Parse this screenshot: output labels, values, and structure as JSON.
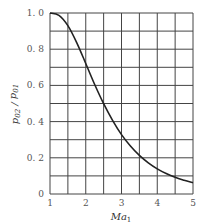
{
  "chart_data": {
    "type": "line",
    "title": "",
    "xlabel": "Ma1",
    "ylabel": "p02 / p01",
    "xlim": [
      1,
      5
    ],
    "ylim": [
      0,
      1.0
    ],
    "grid": true,
    "x_grid_step": 0.5,
    "y_grid_step": 0.1,
    "x_ticks": [
      "1",
      "2",
      "3",
      "4",
      "5"
    ],
    "y_ticks": [
      "0",
      "0.2",
      "0.4",
      "0.6",
      "0.8",
      "1.0"
    ],
    "y_tick_labels": [
      "0",
      "0. 2",
      "0. 4",
      "0. 6",
      "0. 8",
      "1. 0"
    ],
    "legend": null,
    "series": [
      {
        "name": "p02/p01",
        "x": [
          1.0,
          1.25,
          1.5,
          1.75,
          2.0,
          2.25,
          2.5,
          2.75,
          3.0,
          3.25,
          3.5,
          3.75,
          4.0,
          4.25,
          4.5,
          4.75,
          5.0
        ],
        "y": [
          1.0,
          0.987,
          0.93,
          0.835,
          0.721,
          0.605,
          0.499,
          0.407,
          0.328,
          0.265,
          0.213,
          0.172,
          0.139,
          0.113,
          0.092,
          0.076,
          0.062
        ]
      }
    ],
    "colors": {
      "line": "#222222",
      "grid": "#444444",
      "text": "#555555"
    }
  }
}
